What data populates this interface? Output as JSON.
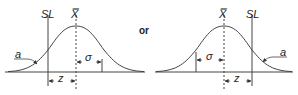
{
  "figure": {
    "connector": "or",
    "stroke_color": "#333333",
    "left_diagram": {
      "spec_limit_label": "SL",
      "mean_label": "X̿",
      "tail_label": "a",
      "sigma_label": "σ",
      "z_label": "z",
      "spec_limit_side": "left"
    },
    "right_diagram": {
      "spec_limit_label": "SL",
      "mean_label": "X̿",
      "tail_label": "a",
      "sigma_label": "σ",
      "z_label": "z",
      "spec_limit_side": "right"
    }
  }
}
